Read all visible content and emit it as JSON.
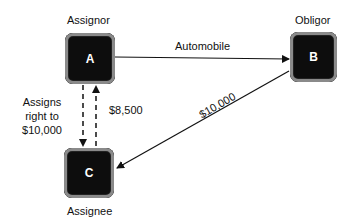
{
  "nodes": {
    "a": {
      "letter": "A",
      "role": "Assignor"
    },
    "b": {
      "letter": "B",
      "role": "Obligor"
    },
    "c": {
      "letter": "C",
      "role": "Assignee"
    }
  },
  "edges": {
    "a_to_b": "Automobile",
    "a_to_c": [
      "Assigns",
      "right to",
      "$10,000"
    ],
    "c_to_a": "$8,500",
    "b_to_c": "$10,000"
  }
}
